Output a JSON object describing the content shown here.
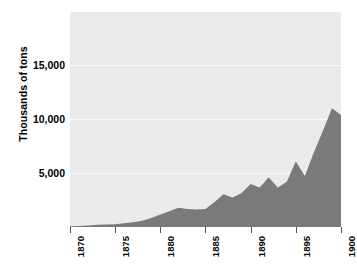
{
  "chart_data": {
    "type": "area",
    "title": "",
    "xlabel": "",
    "ylabel": "Thousands of tons",
    "xlim": [
      1870,
      1900
    ],
    "ylim": [
      0,
      19000
    ],
    "grid": true,
    "legend": "none",
    "series_color": "#7a7a7a",
    "plot_background": "#ebebeb",
    "gridline_color": "#fbfbfb",
    "x_tick_labels": [
      "1870",
      "1875",
      "1880",
      "1885",
      "1890",
      "1895",
      "1900"
    ],
    "x_ticks": [
      1870,
      1875,
      1880,
      1885,
      1890,
      1895,
      1900
    ],
    "y_tick_labels": [
      "5,000",
      "10,000",
      "15,000"
    ],
    "y_ticks": [
      5000,
      10000,
      15000
    ],
    "x": [
      1870,
      1871,
      1872,
      1873,
      1874,
      1875,
      1876,
      1877,
      1878,
      1879,
      1880,
      1881,
      1882,
      1883,
      1884,
      1885,
      1886,
      1887,
      1888,
      1889,
      1890,
      1891,
      1892,
      1893,
      1894,
      1895,
      1896,
      1897,
      1898,
      1899,
      1900
    ],
    "values": [
      60,
      90,
      140,
      190,
      220,
      250,
      330,
      420,
      560,
      800,
      1100,
      1400,
      1700,
      1600,
      1550,
      1600,
      2200,
      2900,
      2600,
      3000,
      3800,
      3500,
      4400,
      3500,
      4000,
      5800,
      4500,
      6600,
      8500,
      10500,
      9900
    ],
    "series": [
      {
        "name": "Production",
        "values": [
          60,
          90,
          140,
          190,
          220,
          250,
          330,
          420,
          560,
          800,
          1100,
          1400,
          1700,
          1600,
          1550,
          1600,
          2200,
          2900,
          2600,
          3000,
          3800,
          3500,
          4400,
          3500,
          4000,
          5800,
          4500,
          6600,
          8500,
          10500,
          9900
        ]
      }
    ]
  }
}
